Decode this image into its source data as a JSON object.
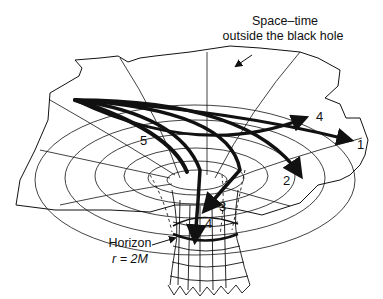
{
  "diagram": {
    "type": "embedding-diagram",
    "labels": {
      "spacetime_line1": "Space–time",
      "spacetime_line2": "outside the black hole",
      "horizon_line1": "Horizon",
      "horizon_line2": "r = 2M"
    },
    "ray_labels": [
      "1",
      "2",
      "3",
      "4",
      "4",
      "5"
    ],
    "colors": {
      "ink": "#111111",
      "background": "#ffffff"
    }
  }
}
